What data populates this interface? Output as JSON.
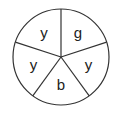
{
  "diagram": {
    "type": "spinner",
    "sectors": [
      {
        "label": "g"
      },
      {
        "label": "y"
      },
      {
        "label": "b"
      },
      {
        "label": "y"
      },
      {
        "label": "y"
      }
    ]
  }
}
